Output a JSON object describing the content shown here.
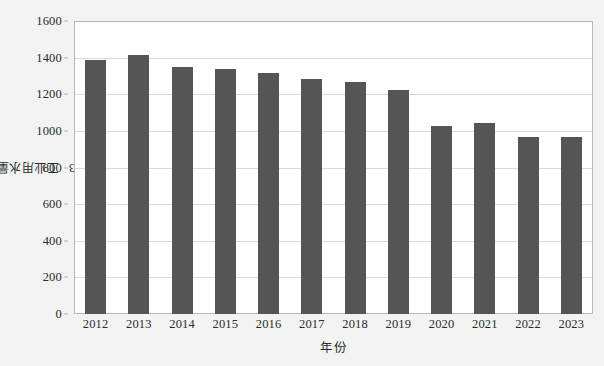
{
  "chart_data": {
    "type": "bar",
    "title": "",
    "subtitle": "",
    "xlabel": "年份",
    "ylabel": "工业用水量 / 亿 m³",
    "ylabel_main": "工业用水量 / 亿 m",
    "ylabel_exponent": "3",
    "categories": [
      "2012",
      "2013",
      "2014",
      "2015",
      "2016",
      "2017",
      "2018",
      "2019",
      "2020",
      "2021",
      "2022",
      "2023"
    ],
    "values": [
      1385,
      1413,
      1347,
      1336,
      1314,
      1281,
      1265,
      1226,
      1028,
      1045,
      968,
      968
    ],
    "series": [
      {
        "name": "工业用水量",
        "values": [
          1385,
          1413,
          1347,
          1336,
          1314,
          1281,
          1265,
          1226,
          1028,
          1045,
          968,
          968
        ]
      }
    ],
    "ylim": [
      0,
      1600
    ],
    "yticks": [
      0,
      200,
      400,
      600,
      800,
      1000,
      1200,
      1400,
      1600
    ],
    "ytick_labels": [
      "0",
      "200",
      "400",
      "600",
      "800",
      "1000",
      "1200",
      "1400",
      "1600"
    ],
    "grid": "horizontal",
    "legend": "none",
    "annotations": [],
    "colors": {
      "bar": "#555555",
      "plot_background": "#ffffff",
      "figure_background": "#f3f3f3",
      "gridline": "#d9d9d9",
      "axis_border": "#b8b8b8",
      "text": "#2b2b2b"
    }
  }
}
